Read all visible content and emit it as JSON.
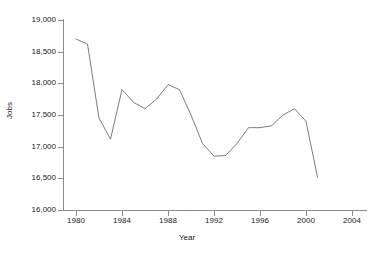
{
  "chart_data": {
    "type": "line",
    "title": "",
    "xlabel": "Year",
    "ylabel": "Jobs",
    "xlim": [
      1979,
      2005
    ],
    "ylim": [
      16000,
      19000
    ],
    "grid": false,
    "legend": null,
    "x_ticks": [
      1980,
      1984,
      1988,
      1992,
      1996,
      2000,
      2004
    ],
    "x_tick_labels": [
      "1980",
      "1984",
      "1988",
      "1992",
      "1996",
      "2000",
      "2004"
    ],
    "y_ticks": [
      16000,
      16500,
      17000,
      17500,
      18000,
      18500,
      19000
    ],
    "y_tick_labels": [
      "16,000",
      "16,500",
      "17,000",
      "17,500",
      "18,000",
      "18,500",
      "19,000"
    ],
    "series": [
      {
        "name": "Jobs",
        "color": "#6e6e6e",
        "x": [
          1980,
          1981,
          1982,
          1983,
          1984,
          1985,
          1986,
          1987,
          1988,
          1989,
          1990,
          1991,
          1992,
          1993,
          1994,
          1995,
          1996,
          1997,
          1998,
          1999,
          2000,
          2001
        ],
        "values": [
          18700,
          18620,
          17450,
          17120,
          17900,
          17700,
          17600,
          17750,
          17980,
          17900,
          17500,
          17050,
          16850,
          16860,
          17050,
          17300,
          17300,
          17330,
          17500,
          17600,
          17400,
          16520
        ]
      }
    ]
  },
  "axes": {
    "y_title": "Jobs",
    "x_title": "Year"
  },
  "colors": {
    "line": "#6e6e6e",
    "axis": "#8c8c8c",
    "text": "#222222",
    "background": "#ffffff"
  }
}
